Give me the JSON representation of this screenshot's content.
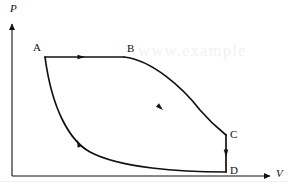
{
  "figure": {
    "kind": "pv-cycle-diagram",
    "background_color": "#ffffff",
    "line_color": "#111111",
    "width": 288,
    "height": 193
  },
  "axes": {
    "y_axis": {
      "label": "P",
      "name": "pressure",
      "style": "italic",
      "x": 12,
      "y_bottom": 176,
      "y_top": 22,
      "arrow": "up"
    },
    "x_axis": {
      "label": "V",
      "name": "volume",
      "style": "italic",
      "y": 176,
      "x_left": 12,
      "x_right": 272,
      "arrow": "right"
    }
  },
  "points": [
    {
      "label": "A",
      "x": 45,
      "y": 57,
      "label_x": 33,
      "label_y": 42
    },
    {
      "label": "B",
      "x": 124,
      "y": 57,
      "label_x": 127,
      "label_y": 43
    },
    {
      "label": "C",
      "x": 226,
      "y": 135,
      "label_x": 230,
      "label_y": 129
    },
    {
      "label": "D",
      "x": 226,
      "y": 172,
      "label_x": 230,
      "label_y": 165
    }
  ],
  "segments": [
    {
      "name": "A-to-B",
      "from": "A",
      "to": "B",
      "kind": "straight-horizontal",
      "path": "M 45 57 L 124 57",
      "arrow_x": 85,
      "arrow_y": 57,
      "arrow_angle": 0
    },
    {
      "name": "B-to-C",
      "from": "B",
      "to": "C",
      "kind": "curve-expansion",
      "path": "M 124 57 C 152 60, 183 88, 200 110 C 212 124, 221 131, 226 135",
      "arrow_x": 163,
      "arrow_y": 110,
      "arrow_angle": 42
    },
    {
      "name": "C-to-D",
      "from": "C",
      "to": "D",
      "kind": "straight-vertical",
      "path": "M 226 135 L 226 172",
      "arrow_x": 226,
      "arrow_y": 157,
      "arrow_angle": 90
    },
    {
      "name": "D-to-A",
      "from": "D",
      "to": "A",
      "kind": "curve-compression",
      "path": "M 226 172 C 180 172, 120 168, 90 152 C 70 141, 52 110, 45 57",
      "arrow_x": 77,
      "arrow_y": 140,
      "arrow_angle": 248
    }
  ],
  "watermark": {
    "text": "www.example",
    "visible": true
  }
}
